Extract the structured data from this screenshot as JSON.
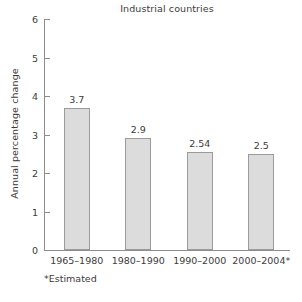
{
  "chart_data": {
    "type": "bar",
    "title": "Industrial countries",
    "xlabel": "",
    "ylabel": "Annual percentage change",
    "categories": [
      "1965–1980",
      "1980–1990",
      "1990–2000",
      "2000–2004*"
    ],
    "values": [
      3.7,
      2.9,
      2.54,
      2.5
    ],
    "data_labels": [
      "3.7",
      "2.9",
      "2.54",
      "2.5"
    ],
    "ylim": [
      0,
      6
    ],
    "yticks": [
      0,
      1,
      2,
      3,
      4,
      5,
      6
    ],
    "ytick_labels": [
      "0",
      "1",
      "2",
      "3",
      "4",
      "5",
      "6"
    ],
    "grid": false,
    "legend": null,
    "legend_position": "none",
    "annotations": [
      "*Estimated"
    ],
    "colors": {
      "bar_fill": "#dcdcdc",
      "bar_border": "#9b9b9b",
      "axis": "#8d8d8d",
      "text": "#3b3b3b",
      "background": "#ffffff"
    }
  },
  "footnote": {
    "text": "*Estimated"
  }
}
